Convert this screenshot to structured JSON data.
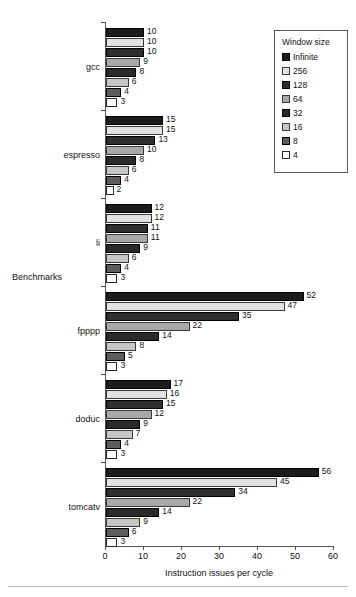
{
  "chart_data": {
    "type": "bar",
    "orientation": "horizontal",
    "title": "",
    "xlabel": "Instruction issues per cycle",
    "ylabel": "Benchmarks",
    "xlim": [
      0,
      60
    ],
    "xticks": [
      0,
      10,
      20,
      30,
      40,
      50,
      60
    ],
    "grid": false,
    "legend_position": "top-right",
    "legend_title": "Window size",
    "categories": [
      "gcc",
      "espresso",
      "li",
      "fpppp",
      "doduc",
      "tomcatv"
    ],
    "series": [
      {
        "name": "Infinite",
        "color": "#1c1c1c",
        "values": [
          10,
          15,
          12,
          52,
          17,
          56
        ]
      },
      {
        "name": "256",
        "color": "#e2e2e2",
        "values": [
          10,
          15,
          12,
          47,
          16,
          45
        ]
      },
      {
        "name": "128",
        "color": "#2f2f2f",
        "values": [
          10,
          13,
          11,
          35,
          15,
          34
        ]
      },
      {
        "name": "64",
        "color": "#a8a8a8",
        "values": [
          9,
          10,
          11,
          22,
          12,
          22
        ]
      },
      {
        "name": "32",
        "color": "#2a2a2a",
        "values": [
          8,
          8,
          9,
          14,
          9,
          14
        ]
      },
      {
        "name": "16",
        "color": "#c6c6c6",
        "values": [
          6,
          6,
          6,
          8,
          7,
          9
        ]
      },
      {
        "name": "8",
        "color": "#5d5d5d",
        "values": [
          4,
          4,
          4,
          5,
          4,
          6
        ]
      },
      {
        "name": "4",
        "color": "#ffffff",
        "values": [
          3,
          2,
          3,
          3,
          3,
          3
        ]
      }
    ]
  },
  "axis": {
    "x_title": "Instruction issues per cycle",
    "y_title": "Benchmarks",
    "x_tick_labels": [
      "0",
      "10",
      "20",
      "30",
      "40",
      "50",
      "60"
    ]
  },
  "legend": {
    "title": "Window size",
    "items": [
      {
        "label": "Infinite",
        "swatch_class": "s-infinite"
      },
      {
        "label": "256",
        "swatch_class": "s-256"
      },
      {
        "label": "128",
        "swatch_class": "s-128"
      },
      {
        "label": "64",
        "swatch_class": "s-64"
      },
      {
        "label": "32",
        "swatch_class": "s-32"
      },
      {
        "label": "16",
        "swatch_class": "s-16"
      },
      {
        "label": "8",
        "swatch_class": "s-8"
      },
      {
        "label": "4",
        "swatch_class": "s-4"
      }
    ]
  }
}
